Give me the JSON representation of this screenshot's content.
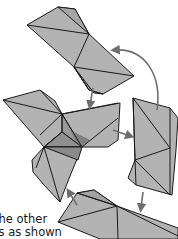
{
  "diagram": {
    "type": "origami-folding-steps",
    "colors": {
      "paper": "#b3b3b3",
      "paper_dark": "#8f8f8f",
      "outline": "#1a1a1a",
      "arrow": "#6e6e6e",
      "background": "#ffffff"
    },
    "pieces": [
      {
        "id": "top-unit",
        "label": "Top folded unit"
      },
      {
        "id": "center-assembly",
        "label": "Center assembled unit"
      },
      {
        "id": "right-unit",
        "label": "Right folded unit"
      },
      {
        "id": "bottom-unit",
        "label": "Bottom folded unit"
      }
    ],
    "arrows": [
      {
        "id": "arrow-right-to-top",
        "description": "Curved arrow from right unit up to top unit"
      },
      {
        "id": "arrow-top-to-center",
        "description": "Arrow from top unit down into center assembly"
      },
      {
        "id": "arrow-center-to-right",
        "description": "Arrow from center assembly to right unit"
      },
      {
        "id": "arrow-right-to-bottom",
        "description": "Arrow from right unit down to bottom unit"
      },
      {
        "id": "arrow-bottom-to-center",
        "description": "Arrow from bottom unit up to center assembly"
      }
    ]
  },
  "caption": {
    "line1": "the other",
    "line2": "ts as shown"
  }
}
